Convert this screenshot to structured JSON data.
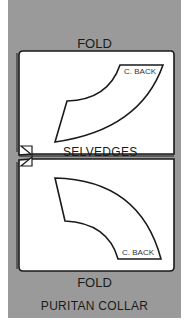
{
  "diagram": {
    "title": "PURITAN COLLAR",
    "top_label": "FOLD",
    "bottom_label": "FOLD",
    "center_label": "SELVEDGES",
    "pieces": [
      {
        "label": "C. BACK",
        "position": "top"
      },
      {
        "label": "C. BACK",
        "position": "bottom"
      }
    ],
    "colors": {
      "background_panel": "#9a9a9a",
      "fabric": "#ffffff",
      "outline": "#1a1a1a"
    }
  }
}
